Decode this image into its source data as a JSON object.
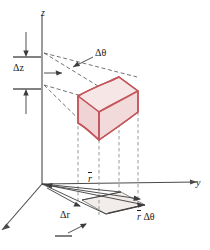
{
  "figure": {
    "type": "technical-diagram",
    "background_color": "#ffffff"
  },
  "axes": {
    "vertical": {
      "name": "z-axis",
      "label": "z",
      "direction": "up"
    },
    "horizontal": {
      "name": "y-axis",
      "label": "y",
      "direction": "right"
    },
    "depth": {
      "name": "x-axis",
      "label": "",
      "direction": "down-left"
    },
    "line_color": "#4a4a4a"
  },
  "labels": {
    "z": "z",
    "y": "y",
    "delta_z": "Δz",
    "delta_theta": "Δθ",
    "r_bar": "r",
    "delta_r": "Δr",
    "r_bar_delta_theta_prefix": "r",
    "r_bar_delta_theta_suffix": " Δθ"
  },
  "volume_element": {
    "name": "cylindrical-volume-element",
    "fill_color": "#f4dcdd",
    "top_fill_color": "#f7e6e6",
    "side_fill_color": "#eecdcf",
    "stroke_color": "#c4565b"
  },
  "base_region": {
    "name": "base-projection-area",
    "fill_color": "#f1ece9",
    "stroke_color": "#6e6e6e"
  },
  "guides": {
    "leader_color": "#5a5a5a",
    "projection_color": "#9a9a9a",
    "dimension_color": "#3c3c3c"
  }
}
